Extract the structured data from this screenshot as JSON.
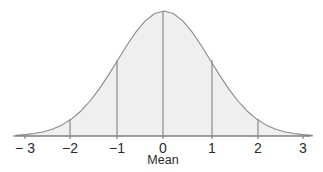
{
  "figure": {
    "title": "",
    "background_color": "#ffffff",
    "width": 323,
    "height": 172
  },
  "axis": {
    "caption": "Mean",
    "caption_x": 163,
    "caption_y": 153,
    "line_color": "#7a7a7a",
    "baseline_y": 136,
    "x_start": 13,
    "x_end": 310
  },
  "ticks": [
    {
      "label": "− 3",
      "value": -3,
      "x": 25,
      "has_vline": false
    },
    {
      "label": "−2",
      "value": -2,
      "x": 70,
      "has_vline": true
    },
    {
      "label": "−1",
      "value": -1,
      "x": 117,
      "has_vline": true
    },
    {
      "label": "0",
      "value": 0,
      "x": 163,
      "has_vline": true
    },
    {
      "label": "1",
      "value": 1,
      "x": 212,
      "has_vline": true
    },
    {
      "label": "2",
      "value": 2,
      "x": 258,
      "has_vline": true
    },
    {
      "label": "3",
      "value": 3,
      "x": 303,
      "has_vline": false
    }
  ],
  "curve": {
    "fill_color": "#efefef",
    "stroke_color": "#8a8a8a",
    "stroke_width": 1.1,
    "peak_x": 163,
    "peak_y": 11,
    "vline_color": "#8a8a8a"
  },
  "chart_data": {
    "type": "area",
    "title": "",
    "subtitle": "",
    "xlabel": "Mean",
    "ylabel": "",
    "grid": false,
    "legend": false,
    "distribution": "normal",
    "mean": 0,
    "std_dev": 1,
    "xlim": [
      -3.2,
      3.2
    ],
    "ylim": [
      0,
      0.4
    ],
    "xticks": [
      -3,
      -2,
      -1,
      0,
      1,
      2,
      3
    ],
    "xticklabels": [
      "− 3",
      "−2",
      "−1",
      "0",
      "1",
      "2",
      "3"
    ],
    "annotations": [
      "Mean"
    ],
    "vertical_lines_at": [
      -2,
      -1,
      0,
      1,
      2
    ],
    "x": [
      -3.2,
      -3.0,
      -2.8,
      -2.6,
      -2.4,
      -2.2,
      -2.0,
      -1.8,
      -1.6,
      -1.4,
      -1.2,
      -1.0,
      -0.8,
      -0.6,
      -0.4,
      -0.2,
      0.0,
      0.2,
      0.4,
      0.6,
      0.8,
      1.0,
      1.2,
      1.4,
      1.6,
      1.8,
      2.0,
      2.2,
      2.4,
      2.6,
      2.8,
      3.0,
      3.2
    ],
    "y": [
      0.0024,
      0.0044,
      0.0079,
      0.0136,
      0.0224,
      0.0355,
      0.054,
      0.079,
      0.1109,
      0.1497,
      0.1942,
      0.242,
      0.2897,
      0.3332,
      0.3683,
      0.391,
      0.3989,
      0.391,
      0.3683,
      0.3332,
      0.2897,
      0.242,
      0.1942,
      0.1497,
      0.1109,
      0.079,
      0.054,
      0.0355,
      0.0224,
      0.0136,
      0.0079,
      0.0044,
      0.0024
    ]
  }
}
